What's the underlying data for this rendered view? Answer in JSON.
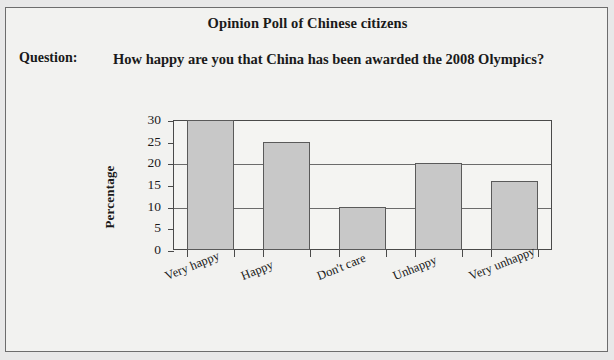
{
  "page": {
    "background_color": "#e8e8e8",
    "panel_background": "#f2f2f0",
    "border_color": "#6d6d6d"
  },
  "header": {
    "title": "Opinion Poll of Chinese citizens",
    "question_label": "Question:",
    "question_text": "How happy are you that China has been awarded the 2008 Olympics?"
  },
  "chart_data": {
    "type": "bar",
    "title": "",
    "xlabel": "",
    "ylabel": "Percentage",
    "categories": [
      "Very happy",
      "Happy",
      "Don't care",
      "Unhappy",
      "Very unhappy"
    ],
    "values": [
      30,
      25,
      10,
      20,
      16
    ],
    "ylim": [
      0,
      30
    ],
    "yticks": [
      0,
      5,
      10,
      15,
      20,
      25,
      30
    ],
    "ytick_labels": [
      "0",
      "5",
      "10",
      "15",
      "20",
      "25",
      "30"
    ],
    "gridlines": [
      10,
      20,
      30
    ],
    "grid": true,
    "legend": "none",
    "bar_fill_color": "#c8c8c8",
    "bar_border_color": "#5a5a5a",
    "axis_color": "#4a4a4a"
  }
}
